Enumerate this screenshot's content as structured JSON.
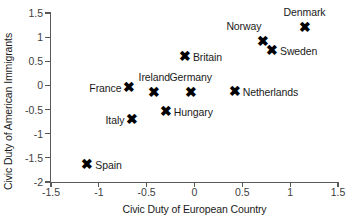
{
  "chart_data": {
    "type": "scatter",
    "title": "",
    "xlabel": "Civic Duty of European Country",
    "ylabel": "Civic Duty of American Immigrants",
    "xlim": [
      -1.5,
      1.5
    ],
    "ylim": [
      -2,
      1.5
    ],
    "xticks": [
      "-1.5",
      "-1",
      "-0.5",
      "0",
      "0.5",
      "1",
      "1.5"
    ],
    "xtick_values": [
      -1.5,
      -1,
      -0.5,
      0,
      0.5,
      1,
      1.5
    ],
    "yticks": [
      "1.5",
      "1",
      "0.5",
      "0",
      "-0.5",
      "-1",
      "-1.5",
      "-2"
    ],
    "ytick_values": [
      1.5,
      1,
      0.5,
      0,
      -0.5,
      -1,
      -1.5,
      -2
    ],
    "grid": false,
    "legend": "none",
    "marker": "x",
    "marker_color": "#000000",
    "axis_color": "#595959",
    "points": [
      {
        "label": "Denmark",
        "x": 1.15,
        "y": 1.19,
        "label_pos": "above"
      },
      {
        "label": "Norway",
        "x": 0.72,
        "y": 0.9,
        "label_pos": "above-left"
      },
      {
        "label": "Sweden",
        "x": 0.81,
        "y": 0.73,
        "label_pos": "right"
      },
      {
        "label": "Britain",
        "x": -0.1,
        "y": 0.6,
        "label_pos": "right"
      },
      {
        "label": "France",
        "x": -0.68,
        "y": -0.04,
        "label_pos": "left"
      },
      {
        "label": "Ireland",
        "x": -0.42,
        "y": -0.15,
        "label_pos": "above"
      },
      {
        "label": "Germany",
        "x": -0.04,
        "y": -0.15,
        "label_pos": "above"
      },
      {
        "label": "Netherlands",
        "x": 0.42,
        "y": -0.13,
        "label_pos": "right"
      },
      {
        "label": "Hungary",
        "x": -0.3,
        "y": -0.53,
        "label_pos": "right"
      },
      {
        "label": "Italy",
        "x": -0.65,
        "y": -0.7,
        "label_pos": "left"
      },
      {
        "label": "Spain",
        "x": -1.12,
        "y": -1.63,
        "label_pos": "right"
      }
    ]
  },
  "marker_glyph": "✖"
}
